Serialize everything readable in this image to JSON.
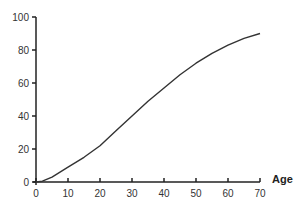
{
  "chart_data": {
    "type": "line",
    "title": "",
    "xlabel": "Age",
    "ylabel": "",
    "xlim": [
      0,
      70
    ],
    "ylim": [
      0,
      100
    ],
    "x_ticks": [
      0,
      10,
      20,
      30,
      40,
      50,
      60,
      70
    ],
    "y_ticks": [
      0,
      20,
      40,
      60,
      80,
      100
    ],
    "grid": false,
    "legend": null,
    "series": [
      {
        "name": "",
        "x": [
          0,
          2,
          5,
          10,
          15,
          20,
          25,
          30,
          35,
          40,
          45,
          50,
          55,
          60,
          65,
          70
        ],
        "values": [
          0,
          0.5,
          3,
          9,
          15,
          22,
          31,
          40,
          49,
          57,
          65,
          72,
          78,
          83,
          87,
          90
        ]
      }
    ],
    "colors": {
      "line": "#333333",
      "axis": "#222222"
    }
  }
}
